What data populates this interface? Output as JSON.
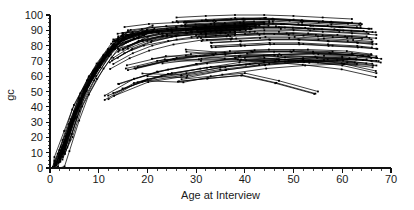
{
  "chart_data": {
    "type": "line",
    "title": "",
    "subtitle": "",
    "xlabel": "Age at Interview",
    "ylabel": "gc",
    "xlim": [
      0,
      70
    ],
    "ylim": [
      0,
      100
    ],
    "grid": false,
    "legend": "none",
    "x_ticks": [
      0,
      10,
      20,
      30,
      40,
      50,
      60,
      70
    ],
    "x_tick_labels": [
      "0",
      "10",
      "20",
      "30",
      "40",
      "50",
      "60",
      "70"
    ],
    "x_minor_step": 2,
    "y_ticks": [
      0,
      10,
      20,
      30,
      40,
      50,
      60,
      70,
      80,
      90,
      100
    ],
    "y_tick_labels": [
      "0",
      "10",
      "20",
      "30",
      "40",
      "50",
      "60",
      "70",
      "80",
      "90",
      "100"
    ],
    "y_minor_step": 2.5,
    "line_color": "#000000",
    "marker_color": "#000000",
    "background_color": "#ffffff",
    "series": [
      {
        "name": "s1",
        "x": [
          1,
          2,
          4,
          6,
          8,
          11,
          14
        ],
        "y": [
          2,
          8,
          29,
          45,
          60,
          74,
          85
        ]
      },
      {
        "name": "s2",
        "x": [
          1,
          2,
          4,
          6,
          8,
          11,
          14
        ],
        "y": [
          1,
          6,
          24,
          41,
          56,
          71,
          83
        ]
      },
      {
        "name": "s3",
        "x": [
          2,
          3,
          5,
          7,
          9,
          12,
          15
        ],
        "y": [
          5,
          13,
          33,
          50,
          63,
          77,
          86
        ]
      },
      {
        "name": "s4",
        "x": [
          1,
          2,
          4,
          6,
          9,
          12,
          16
        ],
        "y": [
          3,
          10,
          27,
          44,
          62,
          76,
          87
        ]
      },
      {
        "name": "s5",
        "x": [
          2,
          3,
          5,
          8,
          10,
          13,
          17
        ],
        "y": [
          7,
          16,
          36,
          55,
          66,
          79,
          88
        ]
      },
      {
        "name": "s6",
        "x": [
          1,
          2,
          3,
          5,
          7,
          10,
          13
        ],
        "y": [
          0,
          4,
          14,
          34,
          51,
          68,
          81
        ]
      },
      {
        "name": "s7",
        "x": [
          2,
          4,
          6,
          9,
          12,
          15,
          19
        ],
        "y": [
          9,
          22,
          42,
          60,
          74,
          84,
          89
        ]
      },
      {
        "name": "s8",
        "x": [
          1,
          3,
          5,
          7,
          10,
          13,
          18
        ],
        "y": [
          4,
          17,
          35,
          52,
          68,
          80,
          88
        ]
      },
      {
        "name": "s9",
        "x": [
          2,
          3,
          5,
          8,
          11,
          14,
          20
        ],
        "y": [
          6,
          15,
          34,
          54,
          70,
          82,
          90
        ]
      },
      {
        "name": "s10",
        "x": [
          1,
          2,
          4,
          7,
          10,
          14,
          21
        ],
        "y": [
          2,
          9,
          26,
          49,
          67,
          81,
          89
        ]
      },
      {
        "name": "s11",
        "x": [
          13,
          17,
          22,
          28,
          34,
          40
        ],
        "y": [
          84,
          88,
          90,
          91,
          92,
          93
        ]
      },
      {
        "name": "s12",
        "x": [
          14,
          19,
          24,
          30,
          36,
          42
        ],
        "y": [
          86,
          89,
          91,
          92,
          93,
          94
        ]
      },
      {
        "name": "s13",
        "x": [
          13,
          18,
          23,
          29,
          35,
          41
        ],
        "y": [
          80,
          85,
          88,
          89,
          90,
          91
        ]
      },
      {
        "name": "s14",
        "x": [
          15,
          20,
          26,
          32,
          38,
          44
        ],
        "y": [
          88,
          90,
          92,
          93,
          94,
          95
        ]
      },
      {
        "name": "s15",
        "x": [
          14,
          18,
          23,
          28,
          33,
          39
        ],
        "y": [
          76,
          82,
          86,
          88,
          89,
          90
        ]
      },
      {
        "name": "s16",
        "x": [
          13,
          16,
          20,
          25,
          31,
          37
        ],
        "y": [
          72,
          78,
          83,
          86,
          88,
          89
        ]
      },
      {
        "name": "s17",
        "x": [
          16,
          21,
          27,
          33,
          39,
          45
        ],
        "y": [
          90,
          92,
          93,
          94,
          95,
          96
        ]
      },
      {
        "name": "s18",
        "x": [
          13,
          17,
          21,
          26,
          32,
          38
        ],
        "y": [
          68,
          75,
          80,
          84,
          87,
          88
        ]
      },
      {
        "name": "s19",
        "x": [
          14,
          19,
          25,
          31,
          37,
          43
        ],
        "y": [
          83,
          87,
          90,
          91,
          92,
          93
        ]
      },
      {
        "name": "s20",
        "x": [
          15,
          19,
          24,
          29,
          35,
          41
        ],
        "y": [
          78,
          84,
          87,
          89,
          90,
          91
        ]
      },
      {
        "name": "s21",
        "x": [
          30,
          36,
          42,
          48,
          54,
          60,
          66
        ],
        "y": [
          92,
          93,
          94,
          94,
          93,
          92,
          91
        ]
      },
      {
        "name": "s22",
        "x": [
          32,
          38,
          44,
          50,
          56,
          62,
          67
        ],
        "y": [
          88,
          89,
          90,
          90,
          89,
          88,
          87
        ]
      },
      {
        "name": "s23",
        "x": [
          28,
          34,
          40,
          46,
          52,
          58,
          64
        ],
        "y": [
          95,
          96,
          97,
          97,
          96,
          95,
          94
        ]
      },
      {
        "name": "s24",
        "x": [
          31,
          37,
          43,
          49,
          55,
          61,
          66
        ],
        "y": [
          85,
          86,
          87,
          87,
          86,
          85,
          84
        ]
      },
      {
        "name": "s25",
        "x": [
          29,
          35,
          41,
          47,
          53,
          59,
          65
        ],
        "y": [
          90,
          91,
          92,
          92,
          91,
          90,
          89
        ]
      },
      {
        "name": "s26",
        "x": [
          33,
          39,
          45,
          51,
          57,
          63,
          67
        ],
        "y": [
          82,
          83,
          84,
          84,
          83,
          82,
          81
        ]
      },
      {
        "name": "s27",
        "x": [
          27,
          33,
          39,
          45,
          51,
          57,
          63
        ],
        "y": [
          93,
          94,
          95,
          95,
          94,
          93,
          92
        ]
      },
      {
        "name": "s28",
        "x": [
          34,
          40,
          46,
          52,
          58,
          64,
          67
        ],
        "y": [
          79,
          80,
          81,
          81,
          80,
          79,
          78
        ]
      },
      {
        "name": "s29",
        "x": [
          30,
          35,
          41,
          47,
          53,
          59,
          65
        ],
        "y": [
          87,
          88,
          89,
          89,
          88,
          87,
          86
        ]
      },
      {
        "name": "s30",
        "x": [
          26,
          32,
          38,
          44,
          50,
          56,
          62
        ],
        "y": [
          96,
          97,
          98,
          98,
          97,
          96,
          95
        ]
      },
      {
        "name": "s31",
        "x": [
          13,
          20,
          28,
          36,
          44,
          52,
          60,
          66
        ],
        "y": [
          49,
          58,
          62,
          66,
          69,
          71,
          72,
          70
        ]
      },
      {
        "name": "s32",
        "x": [
          14,
          22,
          30,
          38,
          46,
          54,
          62,
          67
        ],
        "y": [
          55,
          63,
          68,
          72,
          74,
          75,
          74,
          72
        ]
      },
      {
        "name": "s33",
        "x": [
          27,
          33,
          40,
          47,
          55
        ],
        "y": [
          58,
          60,
          62,
          57,
          50
        ]
      },
      {
        "name": "s34",
        "x": [
          16,
          24,
          31,
          39,
          47,
          55,
          63
        ],
        "y": [
          64,
          70,
          70,
          70,
          70,
          69,
          68
        ]
      },
      {
        "name": "s35",
        "x": [
          28,
          36,
          44,
          52,
          60,
          67
        ],
        "y": [
          76,
          74,
          72,
          70,
          67,
          62
        ]
      },
      {
        "name": "s36",
        "x": [
          18,
          26,
          34,
          42,
          50,
          58,
          66
        ],
        "y": [
          66,
          72,
          75,
          77,
          77,
          76,
          74
        ]
      },
      {
        "name": "s37",
        "x": [
          40,
          47,
          54,
          61,
          67
        ],
        "y": [
          72,
          71,
          70,
          69,
          67
        ]
      },
      {
        "name": "s38",
        "x": [
          20,
          28,
          36,
          45,
          53,
          61,
          67
        ],
        "y": [
          60,
          59,
          64,
          68,
          70,
          71,
          70
        ]
      },
      {
        "name": "s39",
        "x": [
          12,
          18,
          25,
          33,
          41,
          49,
          57,
          65
        ],
        "y": [
          45,
          56,
          62,
          66,
          68,
          70,
          71,
          71
        ]
      },
      {
        "name": "s40",
        "x": [
          22,
          30,
          38,
          46,
          54,
          62,
          67
        ],
        "y": [
          70,
          73,
          75,
          76,
          76,
          75,
          73
        ]
      }
    ]
  },
  "axes": {
    "y_axis_label": "gc",
    "x_axis_label": "Age at Interview"
  }
}
